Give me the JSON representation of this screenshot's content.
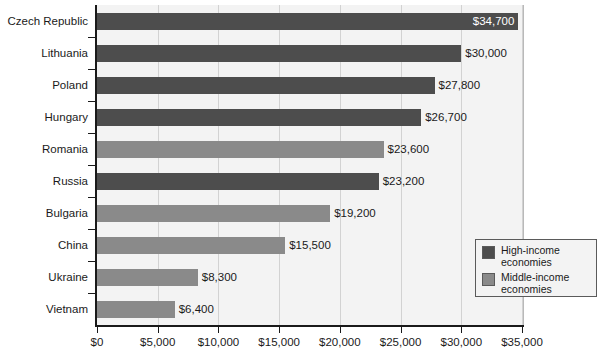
{
  "chart_data": {
    "type": "bar",
    "orientation": "horizontal",
    "title": "",
    "xlabel": "",
    "ylabel": "",
    "xlim": [
      0,
      35000
    ],
    "grid": true,
    "legend_position": "inside-lower-right",
    "categories": [
      "Czech Republic",
      "Lithuania",
      "Poland",
      "Hungary",
      "Romania",
      "Russia",
      "Bulgaria",
      "China",
      "Ukraine",
      "Vietnam"
    ],
    "values": [
      34700,
      30000,
      27800,
      26700,
      23600,
      23200,
      19200,
      15500,
      8300,
      6400
    ],
    "value_labels": [
      "$34,700",
      "$30,000",
      "$27,800",
      "$26,700",
      "$23,600",
      "$23,200",
      "$19,200",
      "$15,500",
      "$8,300",
      "$6,400"
    ],
    "groups": [
      "high",
      "high",
      "high",
      "high",
      "middle",
      "high",
      "middle",
      "middle",
      "middle",
      "middle"
    ],
    "label_placement": [
      "inside",
      "outside",
      "outside",
      "outside",
      "outside",
      "outside",
      "outside",
      "outside",
      "outside",
      "outside"
    ],
    "xticks": [
      0,
      5000,
      10000,
      15000,
      20000,
      25000,
      30000,
      35000
    ],
    "xtick_labels": [
      "$0",
      "$5,000",
      "$10,000",
      "$15,000",
      "$20,000",
      "$25,000",
      "$30,000",
      "$35,000"
    ],
    "series": [
      {
        "name": "High-income economies",
        "key": "high",
        "color": "#4d4d4d"
      },
      {
        "name": "Middle-income economies",
        "key": "middle",
        "color": "#8a8a8a"
      }
    ]
  },
  "legend": {
    "items": [
      {
        "label_line1": "High-income",
        "label_line2": "economies",
        "key": "high"
      },
      {
        "label_line1": "Middle-income",
        "label_line2": "economies",
        "key": "middle"
      }
    ]
  },
  "colors": {
    "high_income": "#4d4d4d",
    "middle_income": "#8a8a8a",
    "plot_background": "#f3f3f3",
    "page_background": "#ffffff",
    "axis": "#1a1a1a",
    "gridline": "#d2d2d2"
  }
}
